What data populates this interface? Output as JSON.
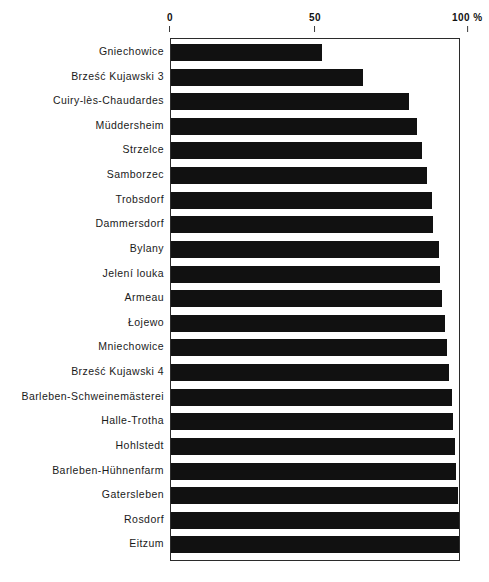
{
  "chart_data": {
    "type": "bar",
    "orientation": "horizontal",
    "title": "",
    "xlabel": "",
    "ylabel": "",
    "xlim": [
      0,
      100
    ],
    "unit": "%",
    "grid": false,
    "legend": null,
    "bar_color": "#111111",
    "frame_color": "#2b2b2b",
    "axis_ticks": [
      {
        "value": 0,
        "label": "0"
      },
      {
        "value": 50,
        "label": "50"
      },
      {
        "value": 100,
        "label": "100 %"
      }
    ],
    "categories": [
      "Gniechowice",
      "Brześć Kujawski 3",
      "Cuiry-lès-Chaudardes",
      "Müddersheim",
      "Strzelce",
      "Samborzec",
      "Trobsdorf",
      "Dammersdorf",
      "Bylany",
      "Jelení louka",
      "Armeau",
      "Łojewo",
      "Mniechowice",
      "Brześć Kujawski 4",
      "Barleben-Schweinemästerei",
      "Halle-Trotha",
      "Hohlstedt",
      "Barleben-Hühnenfarm",
      "Gatersleben",
      "Rosdorf",
      "Eitzum"
    ],
    "values": [
      52.5,
      66.5,
      82.5,
      85.5,
      87.0,
      89.0,
      90.5,
      91.0,
      93.0,
      93.5,
      94.0,
      95.0,
      96.0,
      96.5,
      97.5,
      98.0,
      98.5,
      99.0,
      99.5,
      100.0,
      100.0
    ]
  },
  "caption": {
    "text": ""
  }
}
